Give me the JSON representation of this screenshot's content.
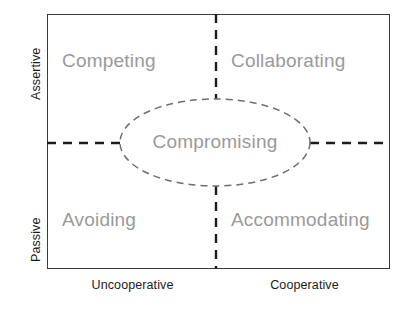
{
  "diagram": {
    "type": "conflict-management-grid",
    "background_color": "#ffffff",
    "frame": {
      "border_color": "#3b3b3b",
      "x": 47,
      "y": 14,
      "width": 343,
      "height": 255
    },
    "colors": {
      "quadrant_label": "#9a9a9a",
      "axis_label": "#1c1c1c",
      "cross_line": "#1c1c1c",
      "ellipse_line": "#6f6f6f"
    },
    "axes": {
      "y_top_label": "Assertive",
      "y_bottom_label": "Passive",
      "x_left_label": "Uncooperative",
      "x_right_label": "Cooperative"
    },
    "quadrants": [
      {
        "key": "top-left",
        "label": "Competing"
      },
      {
        "key": "top-right",
        "label": "Collaborating"
      },
      {
        "key": "bottom-left",
        "label": "Avoiding"
      },
      {
        "key": "bottom-right",
        "label": "Accommodating"
      }
    ],
    "center": {
      "label": "Compromising",
      "shape": "ellipse",
      "cx": 215,
      "cy": 142.5,
      "rx": 95,
      "ry": 43.5
    },
    "cross": {
      "vertical_x": 216,
      "horizontal_y": 143,
      "style": "dashed"
    }
  }
}
